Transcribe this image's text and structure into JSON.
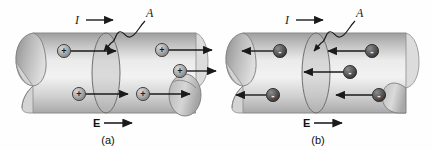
{
  "figure": {
    "background_color": "#fefefe",
    "panels": [
      {
        "id": "a",
        "caption": "(a)",
        "current_label": "I",
        "area_label": "A",
        "field_label": "E",
        "carrier_sign": "+",
        "carrier_symbol": "＋",
        "carrier_fill": "#a8a8a8",
        "carrier_stroke": "#4a4a4a",
        "drift_direction": "right",
        "current_direction": "right",
        "field_direction": "right",
        "cylinder_fill_light": "#e8e8e8",
        "cylinder_fill_mid": "#c6c6c6",
        "cylinder_fill_dark": "#9a9a9a",
        "outline_color": "#6e6e6e",
        "carriers": [
          {
            "x": 64,
            "y": 51,
            "arrow_to": 116,
            "label": "+"
          },
          {
            "x": 162,
            "y": 50,
            "arrow_to": 212,
            "label": "+"
          },
          {
            "x": 180,
            "y": 71,
            "arrow_to": 220,
            "label": "+"
          },
          {
            "x": 79,
            "y": 94,
            "arrow_to": 128,
            "label": "+"
          },
          {
            "x": 143,
            "y": 94,
            "arrow_to": 190,
            "label": "+"
          }
        ]
      },
      {
        "id": "b",
        "caption": "(b)",
        "current_label": "I",
        "area_label": "A",
        "field_label": "E",
        "carrier_sign": "-",
        "carrier_symbol": "－",
        "carrier_fill": "#5a5a5a",
        "carrier_stroke": "#2c2c2c",
        "drift_direction": "left",
        "current_direction": "right",
        "field_direction": "right",
        "cylinder_fill_light": "#e8e8e8",
        "cylinder_fill_mid": "#c6c6c6",
        "cylinder_fill_dark": "#9a9a9a",
        "outline_color": "#6e6e6e",
        "carriers": [
          {
            "x": 64,
            "y": 51,
            "arrow_to": 26,
            "label": "-"
          },
          {
            "x": 156,
            "y": 51,
            "arrow_to": 112,
            "label": "-"
          },
          {
            "x": 134,
            "y": 72,
            "arrow_to": 88,
            "label": "-"
          },
          {
            "x": 57,
            "y": 95,
            "arrow_to": 20,
            "label": "-"
          },
          {
            "x": 163,
            "y": 95,
            "arrow_to": 120,
            "label": "-"
          }
        ]
      }
    ]
  }
}
